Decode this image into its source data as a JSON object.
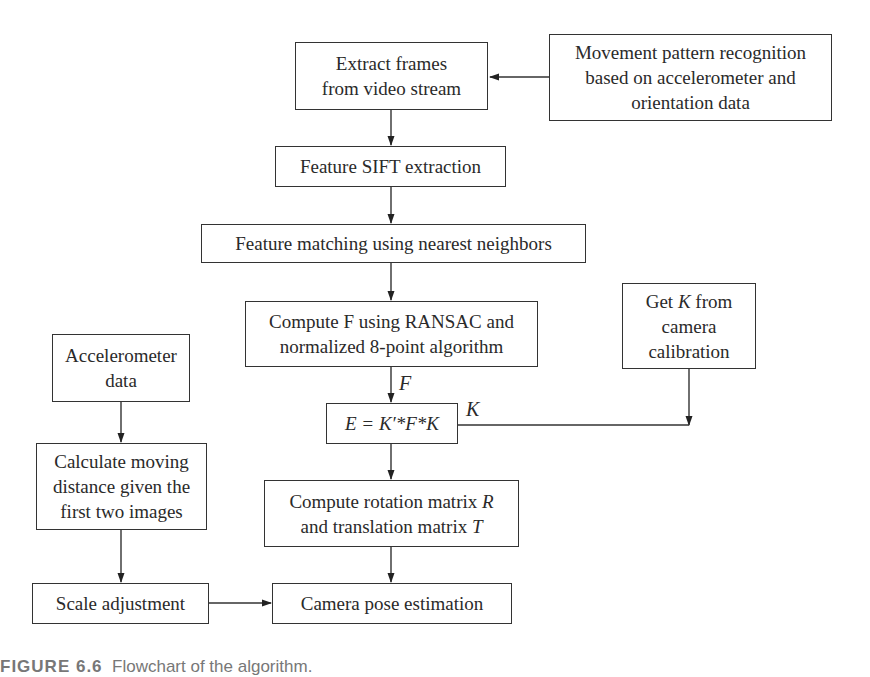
{
  "diagram": {
    "type": "flowchart",
    "nodes": {
      "extract": {
        "lines": [
          "Extract frames",
          "from video stream"
        ]
      },
      "movement": {
        "lines": [
          "Movement pattern recognition",
          "based on accelerometer and",
          "orientation data"
        ]
      },
      "sift": {
        "lines": [
          "Feature SIFT extraction"
        ]
      },
      "matching": {
        "lines": [
          "Feature matching using nearest neighbors"
        ]
      },
      "computeF": {
        "lines": [
          "Compute F using RANSAC and",
          "normalized 8-point algorithm"
        ]
      },
      "getK": {
        "line1_pre": "Get ",
        "line1_var": "K",
        "line1_post": " from",
        "line2": "camera",
        "line3": "calibration"
      },
      "essential": {
        "formula": "E = K′*F*K"
      },
      "accel": {
        "lines": [
          "Accelerometer",
          "data"
        ]
      },
      "calcDist": {
        "lines": [
          "Calculate moving",
          "distance given the",
          "first two images"
        ]
      },
      "computeRT": {
        "line1_pre": "Compute rotation matrix ",
        "line1_var": "R",
        "line2_pre": "and translation matrix ",
        "line2_var": "T"
      },
      "scale": {
        "lines": [
          "Scale adjustment"
        ]
      },
      "pose": {
        "lines": [
          "Camera pose estimation"
        ]
      }
    },
    "edge_labels": {
      "F": "F",
      "K": "K"
    },
    "edges": [
      [
        "movement",
        "extract"
      ],
      [
        "extract",
        "sift"
      ],
      [
        "sift",
        "matching"
      ],
      [
        "matching",
        "computeF"
      ],
      [
        "computeF",
        "essential"
      ],
      [
        "getK",
        "essential"
      ],
      [
        "essential",
        "computeRT"
      ],
      [
        "computeRT",
        "pose"
      ],
      [
        "accel",
        "calcDist"
      ],
      [
        "calcDist",
        "scale"
      ],
      [
        "scale",
        "pose"
      ]
    ]
  },
  "caption": {
    "label": "FIGURE 6.6",
    "text": "Flowchart of the algorithm."
  }
}
